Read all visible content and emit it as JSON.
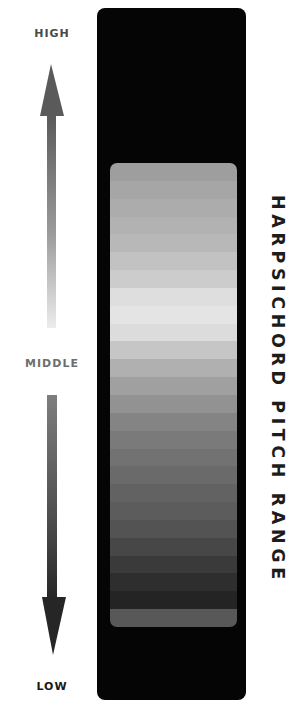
{
  "labels": {
    "high": "HIGH",
    "middle": "MIDDLE",
    "low": "LOW"
  },
  "title": "HARPSICHORD PITCH RANGE",
  "arrows": {
    "up": {
      "icon": "arrow-up-icon",
      "gradient": [
        "#5a5a5a",
        "#e8e8e8"
      ]
    },
    "down": {
      "icon": "arrow-down-icon",
      "gradient": [
        "#7a7a7a",
        "#2a2a2a"
      ]
    }
  },
  "panel": {
    "background": "#050505"
  },
  "scale_bands": [
    "#9e9e9e",
    "#a6a6a6",
    "#acacac",
    "#b2b2b2",
    "#b8b8b8",
    "#c2c2c2",
    "#cccccc",
    "#dedede",
    "#e4e4e4",
    "#dcdcdc",
    "#c6c6c6",
    "#b0b0b0",
    "#a0a0a0",
    "#929292",
    "#848484",
    "#7a7a7a",
    "#727272",
    "#6a6a6a",
    "#626262",
    "#5c5c5c",
    "#535353",
    "#474747",
    "#3a3a3a",
    "#2e2e2e",
    "#242424",
    "#585858"
  ]
}
